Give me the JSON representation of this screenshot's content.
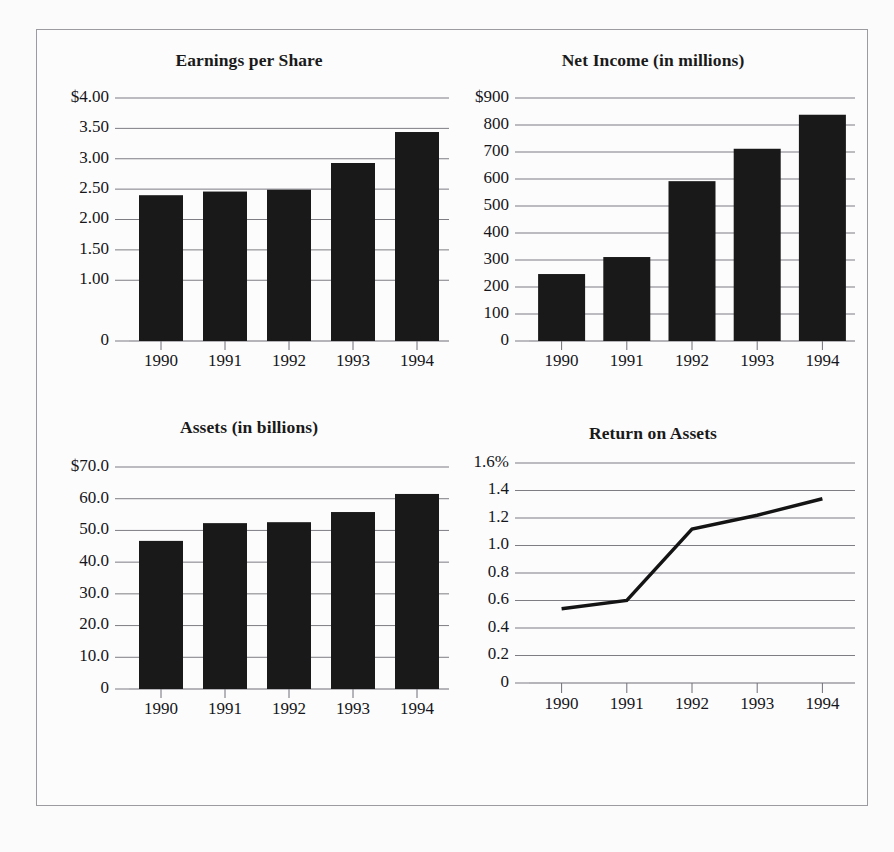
{
  "figure": {
    "background_color": "#fbfbfc",
    "frame_border_color": "#9b9ba0",
    "bar_color": "#191919",
    "gridline_color": "#7d7d83",
    "line_color": "#141414"
  },
  "chart_data": [
    {
      "id": "earnings-per-share",
      "type": "bar",
      "title": "Earnings per Share",
      "xlabel": "",
      "ylabel": "",
      "categories": [
        "1990",
        "1991",
        "1992",
        "1993",
        "1994"
      ],
      "values": [
        2.4,
        2.46,
        2.49,
        2.93,
        3.44
      ],
      "ylim": [
        0,
        4.0
      ],
      "ytick_values": [
        4.0,
        3.5,
        3.0,
        2.5,
        2.0,
        1.5,
        1.0,
        0
      ],
      "ytick_labels": [
        "$4.00",
        "3.50",
        "3.00",
        "2.50",
        "2.00",
        "1.50",
        "1.00",
        "0"
      ],
      "grid": true,
      "legend": "none"
    },
    {
      "id": "net-income",
      "type": "bar",
      "title": "Net Income (in millions)",
      "xlabel": "",
      "ylabel": "",
      "categories": [
        "1990",
        "1991",
        "1992",
        "1993",
        "1994"
      ],
      "values": [
        248,
        311,
        592,
        712,
        838
      ],
      "ylim": [
        0,
        900
      ],
      "ytick_values": [
        900,
        800,
        700,
        600,
        500,
        400,
        300,
        200,
        100,
        0
      ],
      "ytick_labels": [
        "$900",
        "800",
        "700",
        "600",
        "500",
        "400",
        "300",
        "200",
        "100",
        "0"
      ],
      "grid": true,
      "legend": "none"
    },
    {
      "id": "assets",
      "type": "bar",
      "title": "Assets (in billions)",
      "xlabel": "",
      "ylabel": "",
      "categories": [
        "1990",
        "1991",
        "1992",
        "1993",
        "1994"
      ],
      "values": [
        46.7,
        52.3,
        52.6,
        55.8,
        61.5
      ],
      "ylim": [
        0,
        70.0
      ],
      "ytick_values": [
        70.0,
        60.0,
        50.0,
        40.0,
        30.0,
        20.0,
        10.0,
        0
      ],
      "ytick_labels": [
        "$70.0",
        "60.0",
        "50.0",
        "40.0",
        "30.0",
        "20.0",
        "10.0",
        "0"
      ],
      "grid": true,
      "legend": "none"
    },
    {
      "id": "return-on-assets",
      "type": "line",
      "title": "Return on Assets",
      "xlabel": "",
      "ylabel": "",
      "categories": [
        "1990",
        "1991",
        "1992",
        "1993",
        "1994"
      ],
      "values": [
        0.54,
        0.6,
        1.12,
        1.22,
        1.34
      ],
      "ylim": [
        0,
        1.6
      ],
      "ytick_values": [
        1.6,
        1.4,
        1.2,
        1.0,
        0.8,
        0.6,
        0.4,
        0.2,
        0
      ],
      "ytick_labels": [
        "1.6%",
        "1.4",
        "1.2",
        "1.0",
        "0.8",
        "0.6",
        "0.4",
        "0.2",
        "0"
      ],
      "grid": true,
      "legend": "none"
    }
  ]
}
